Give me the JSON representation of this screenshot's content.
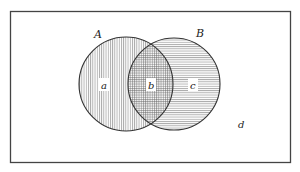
{
  "diagram": {
    "type": "venn",
    "universe": {
      "label": "d"
    },
    "sets": [
      {
        "name": "A",
        "region_label": "a",
        "hatch": "vertical"
      },
      {
        "name": "B",
        "region_label": "c",
        "hatch": "horizontal"
      }
    ],
    "intersection": {
      "region_label": "b",
      "hatch": "crosshatch"
    }
  },
  "colors": {
    "stroke": "#333333",
    "hatch": "#555555",
    "background": "#ffffff"
  }
}
